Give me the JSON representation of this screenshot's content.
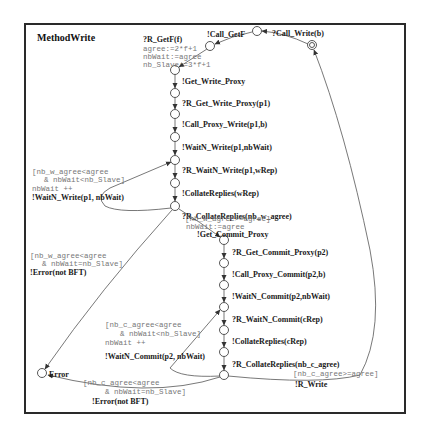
{
  "diagram": {
    "title": "MethodWrite",
    "colors": {
      "frame": "#2a2a2a",
      "edge": "#555555",
      "label": "#1a1a1a",
      "guard": "#777777"
    },
    "initial": {
      "label": "?Call_Write(b)"
    },
    "top": {
      "call_getf": "!Call_GetF",
      "r_getf": "?R_GetF(f)",
      "assign1": "agree:=2*f+1",
      "assign2": "nbWait:=agree",
      "assign3": "nb_Slave:=3*f+1"
    },
    "write_chain": [
      "!Get_Write_Proxy",
      "?R_Get_Write_Proxy(p1)",
      "!Call_Proxy_Write(p1,b)",
      "!WaitN_Write(p1,nbWait)",
      "?R_WaitN_Write(p1,wRep)",
      "!CollateReplies(wRep)",
      "?R_CollateReplies(nb_w_agree)"
    ],
    "write_loop": {
      "guard1": "[nb_w_agree<agree",
      "guard2": "& nbWait<nb_Slave]",
      "update": "nbWait ++",
      "action": "!WaitN_Write(p1, nbWait)"
    },
    "write_error": {
      "guard1": "[nb_w_agree<agree",
      "guard2": "& nbWait=nb_Slave]",
      "action": "!Error(not BFT)"
    },
    "write_ok": {
      "guard": "[nb_w_agree>=agree]",
      "update": "nbWait:=agree",
      "action": "!Get_Commit_Proxy"
    },
    "commit_chain": [
      "?R_Get_Commit_Proxy(p2)",
      "!Call_Proxy_Commit(p2,b)",
      "!WaitN_Commit(p2,nbWait)",
      "?R_WaitN_Commit(cRep)",
      "!CollateReplies(cRep)",
      "?R_CollateReplies(nb_c_agree)"
    ],
    "commit_loop": {
      "guard1": "[nb_c_agree<agree",
      "guard2": "& nbWait<nb_Slave]",
      "update": "nbWait ++",
      "action": "!WaitN_Commit(p2, nbWait)"
    },
    "commit_error": {
      "guard1": "[nb_c_agree<agree",
      "guard2": "& nbWait=nb_Slave]",
      "action": "!Error(not BFT)"
    },
    "commit_ok": {
      "guard": "[nb_c_agree>=agree]",
      "action": "!R_Write"
    },
    "error_state": "Error"
  }
}
